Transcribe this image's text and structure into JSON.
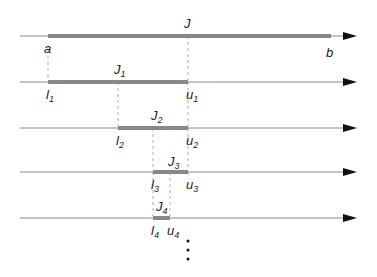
{
  "figure": {
    "type": "nested-intervals",
    "colors": {
      "axis": "#8a8a8a",
      "bar": "#888888",
      "dash": "#9a9a9a",
      "arrow": "#111111",
      "text": "#222222"
    },
    "rows": [
      {
        "y": 36,
        "bar": [
          48,
          331
        ],
        "top_label": {
          "text": "J",
          "sub": "",
          "x": 188
        },
        "left_label": {
          "text": "a",
          "sub": ""
        },
        "right_label": {
          "text": "b",
          "sub": ""
        }
      },
      {
        "y": 82,
        "bar": [
          48,
          188
        ],
        "top_label": {
          "text": "J",
          "sub": "1",
          "x": 118
        },
        "left_label": {
          "text": "l",
          "sub": "1"
        },
        "right_label": {
          "text": "u",
          "sub": "1"
        }
      },
      {
        "y": 128,
        "bar": [
          118,
          188
        ],
        "top_label": {
          "text": "J",
          "sub": "2",
          "x": 153
        },
        "left_label": {
          "text": "l",
          "sub": "2"
        },
        "right_label": {
          "text": "u",
          "sub": "2"
        }
      },
      {
        "y": 172,
        "bar": [
          153,
          188
        ],
        "top_label": {
          "text": "J",
          "sub": "3",
          "x": 170
        },
        "left_label": {
          "text": "l",
          "sub": "3"
        },
        "right_label": {
          "text": "u",
          "sub": "3"
        }
      },
      {
        "y": 218,
        "bar": [
          153,
          170
        ],
        "top_label": {
          "text": "J",
          "sub": "4",
          "x": 161
        },
        "left_label": {
          "text": "l",
          "sub": "4"
        },
        "right_label": {
          "text": "u",
          "sub": "4"
        }
      }
    ],
    "continuation": "⋮"
  }
}
